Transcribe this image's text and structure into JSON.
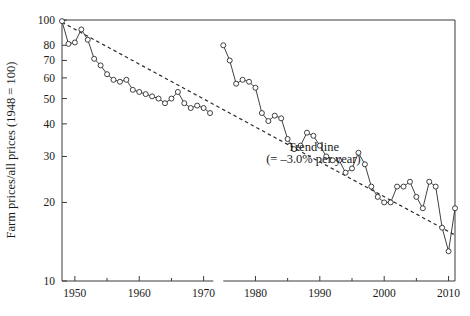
{
  "chart_data": {
    "type": "line",
    "title": "",
    "xlabel": "",
    "ylabel": "Farm prices/all prices (1948 = 100)",
    "xlim": [
      1948,
      2011
    ],
    "ylim": [
      10,
      100
    ],
    "yscale": "log",
    "grid": false,
    "legend_position": "none",
    "axis_break": {
      "present": true,
      "from": 1971.5,
      "to": 1975.0,
      "note": "gap in the x axis between the early and later series segments"
    },
    "ytick_labels": [
      "10",
      "20",
      "30",
      "40",
      "50",
      "60",
      "70",
      "80",
      "100"
    ],
    "ytick_values": [
      10,
      20,
      30,
      40,
      50,
      60,
      70,
      80,
      100
    ],
    "xtick_labels": [
      "1950",
      "1960",
      "1970",
      "1980",
      "1990",
      "2000",
      "2010"
    ],
    "xtick_values": [
      1950,
      1960,
      1970,
      1980,
      1990,
      2000,
      2010
    ],
    "xminor_ticks": [
      1955,
      1965,
      1985,
      1995,
      2005
    ],
    "annotations": [
      {
        "name": "trend-line-label-line1",
        "text": "Trend line",
        "x": 1989,
        "y": 31.5
      },
      {
        "name": "trend-line-label-line2",
        "text": "(= –3.0% per year)",
        "x": 1989,
        "y": 28.2
      }
    ],
    "series": [
      {
        "name": "Farm prices relative to all prices",
        "marker": "open-circle",
        "x": [
          1948,
          1949,
          1950,
          1951,
          1952,
          1953,
          1954,
          1955,
          1956,
          1957,
          1958,
          1959,
          1960,
          1961,
          1962,
          1963,
          1964,
          1965,
          1966,
          1967,
          1968,
          1969,
          1970,
          1971,
          1975,
          1976,
          1977,
          1978,
          1979,
          1980,
          1981,
          1982,
          1983,
          1984,
          1985,
          1986,
          1987,
          1988,
          1989,
          1990,
          1991,
          1992,
          1993,
          1994,
          1995,
          1996,
          1997,
          1998,
          1999,
          2000,
          2001,
          2002,
          2003,
          2004,
          2005,
          2006,
          2007,
          2008,
          2009,
          2010,
          2011
        ],
        "y": [
          99,
          81,
          82,
          92,
          84,
          71,
          67,
          62,
          59,
          58,
          59,
          54,
          53,
          52,
          51,
          50,
          48,
          50,
          53,
          48,
          46,
          47,
          46,
          44,
          80,
          70,
          57,
          59,
          58,
          55,
          44,
          41,
          43,
          42,
          35,
          32,
          33,
          37,
          36,
          33,
          30,
          29,
          29,
          26,
          27,
          31,
          28,
          23,
          21,
          20,
          20,
          23,
          23,
          24,
          21,
          19,
          24,
          23,
          16,
          13,
          19
        ]
      }
    ],
    "trend": {
      "name": "Trend line",
      "style": "dashed",
      "rate_percent_per_year": -3.0,
      "x": [
        1948,
        2011
      ],
      "y": [
        98,
        15
      ]
    }
  }
}
